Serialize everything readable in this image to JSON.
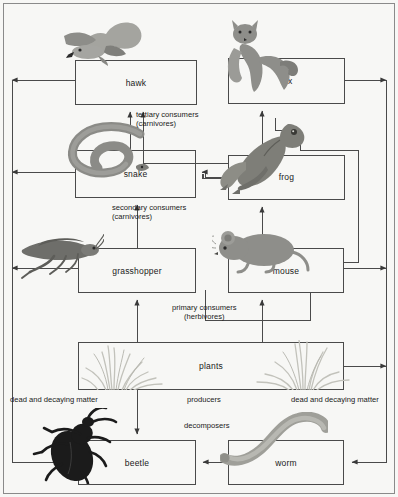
{
  "diagram": {
    "background_color": "#f7f7f5",
    "line_color": "#4a4a4a",
    "nodes": [
      {
        "id": "hawk",
        "label": "hawk",
        "x": 75,
        "y": 60,
        "w": 122,
        "h": 45,
        "organism": "hawk-illustration",
        "trophic": "tertiary consumers"
      },
      {
        "id": "fox",
        "label": "fox",
        "x": 228,
        "y": 58,
        "w": 117,
        "h": 46,
        "organism": "fox-illustration",
        "trophic": "tertiary consumers"
      },
      {
        "id": "snake",
        "label": "snake",
        "x": 75,
        "y": 150,
        "w": 121,
        "h": 48,
        "organism": "snake-illustration",
        "trophic": "secondary consumers"
      },
      {
        "id": "frog",
        "label": "frog",
        "x": 228,
        "y": 155,
        "w": 117,
        "h": 45,
        "organism": "frog-illustration",
        "trophic": "secondary consumers"
      },
      {
        "id": "grasshopper",
        "label": "grasshopper",
        "x": 78,
        "y": 248,
        "w": 118,
        "h": 45,
        "organism": "grasshopper-illustration",
        "trophic": "primary consumers"
      },
      {
        "id": "mouse",
        "label": "mouse",
        "x": 228,
        "y": 248,
        "w": 116,
        "h": 45,
        "organism": "mouse-illustration",
        "trophic": "primary consumers"
      },
      {
        "id": "plants",
        "label": "plants",
        "x": 78,
        "y": 342,
        "w": 266,
        "h": 48,
        "organism": "grass-illustration",
        "trophic": "producers"
      },
      {
        "id": "beetle",
        "label": "beetle",
        "x": 78,
        "y": 440,
        "w": 118,
        "h": 45,
        "organism": "beetle-illustration",
        "trophic": "decomposers"
      },
      {
        "id": "worm",
        "label": "worm",
        "x": 228,
        "y": 440,
        "w": 116,
        "h": 45,
        "organism": "worm-illustration",
        "trophic": "decomposers"
      }
    ],
    "trophic_labels": [
      {
        "id": "tertiary",
        "line1": "tertiary consumers",
        "line2": "(carnivores)",
        "x": 136,
        "y": 110
      },
      {
        "id": "secondary",
        "line1": "secondary consumers",
        "line2": "(carnivores)",
        "x": 112,
        "y": 203
      },
      {
        "id": "primary",
        "line1": "primary consumers",
        "line2": "(herbivores)",
        "x": 172,
        "y": 303
      },
      {
        "id": "producers",
        "line1": "producers",
        "line2": "",
        "x": 187,
        "y": 396
      },
      {
        "id": "decomposers",
        "line1": "decomposers",
        "line2": "",
        "x": 184,
        "y": 422
      }
    ],
    "matter_labels": [
      {
        "id": "matter-left",
        "text": "dead and decaying matter",
        "x": 10,
        "y": 396
      },
      {
        "id": "matter-right",
        "text": "dead and decaying matter",
        "x": 291,
        "y": 396
      }
    ],
    "flows": [
      {
        "from": "plants",
        "to": "grasshopper"
      },
      {
        "from": "plants",
        "to": "mouse"
      },
      {
        "from": "grasshopper",
        "to": "snake"
      },
      {
        "from": "mouse",
        "to": "frog"
      },
      {
        "from": "snake",
        "to": "hawk"
      },
      {
        "from": "frog",
        "to": "hawk"
      },
      {
        "from": "frog",
        "to": "fox"
      },
      {
        "from": "mouse",
        "to": "fox"
      },
      {
        "from": "frog",
        "to": "snake"
      },
      {
        "from": "plants",
        "to": "beetle"
      },
      {
        "from": "worm",
        "to": "beetle"
      },
      {
        "from": "hawk",
        "to": "beetle-via-left-margin"
      },
      {
        "from": "snake",
        "to": "beetle-via-left-margin"
      },
      {
        "from": "grasshopper",
        "to": "beetle-via-left-margin"
      },
      {
        "from": "fox",
        "to": "worm-via-right-margin"
      },
      {
        "from": "mouse",
        "to": "worm-via-right-margin"
      },
      {
        "from": "plants",
        "to": "worm-via-right-margin"
      }
    ]
  }
}
